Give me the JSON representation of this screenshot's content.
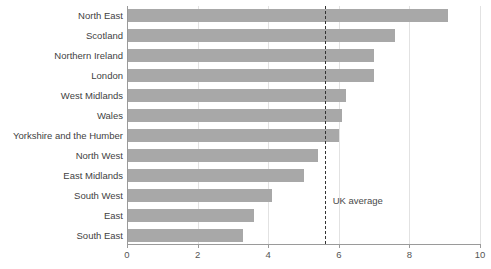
{
  "chart_data": {
    "type": "bar",
    "orientation": "horizontal",
    "title": "",
    "subtitle": "",
    "xlabel": "",
    "ylabel": "",
    "xlim": [
      0,
      10
    ],
    "xticks": [
      0,
      2,
      4,
      6,
      8,
      10
    ],
    "xtick_labels": [
      "0",
      "2",
      "4",
      "6",
      "8",
      "10"
    ],
    "grid": "vertical",
    "legend": "none",
    "bar_color": "#a8a8a8",
    "categories": [
      "North East",
      "Scotland",
      "Northern Ireland",
      "London",
      "West Midlands",
      "Wales",
      "Yorkshire and the Humber",
      "North West",
      "East Midlands",
      "South West",
      "East",
      "South East"
    ],
    "values": [
      9.1,
      7.6,
      7.0,
      7.0,
      6.2,
      6.1,
      6.0,
      5.4,
      5.0,
      4.1,
      3.6,
      3.3
    ],
    "annotations": [
      {
        "label": "UK average",
        "type": "vline",
        "value": 5.6,
        "style": "dashed",
        "color": "#333333"
      }
    ]
  }
}
